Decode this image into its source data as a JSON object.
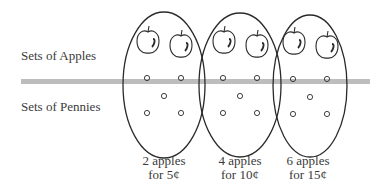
{
  "rows": {
    "apples_label": "Sets of Apples",
    "pennies_label": "Sets of Pennies"
  },
  "sets": [
    {
      "apples": 2,
      "pennies": 5,
      "caption_line1": "2 apples",
      "caption_line2": "for 5¢"
    },
    {
      "apples": 2,
      "pennies": 5,
      "caption_line1": "4 apples",
      "caption_line2": "for 10¢"
    },
    {
      "apples": 2,
      "pennies": 5,
      "caption_line1": "6 apples",
      "caption_line2": "for 15¢"
    }
  ],
  "colors": {
    "divider": "#bdbdbd",
    "stroke": "#2a2a2a"
  }
}
